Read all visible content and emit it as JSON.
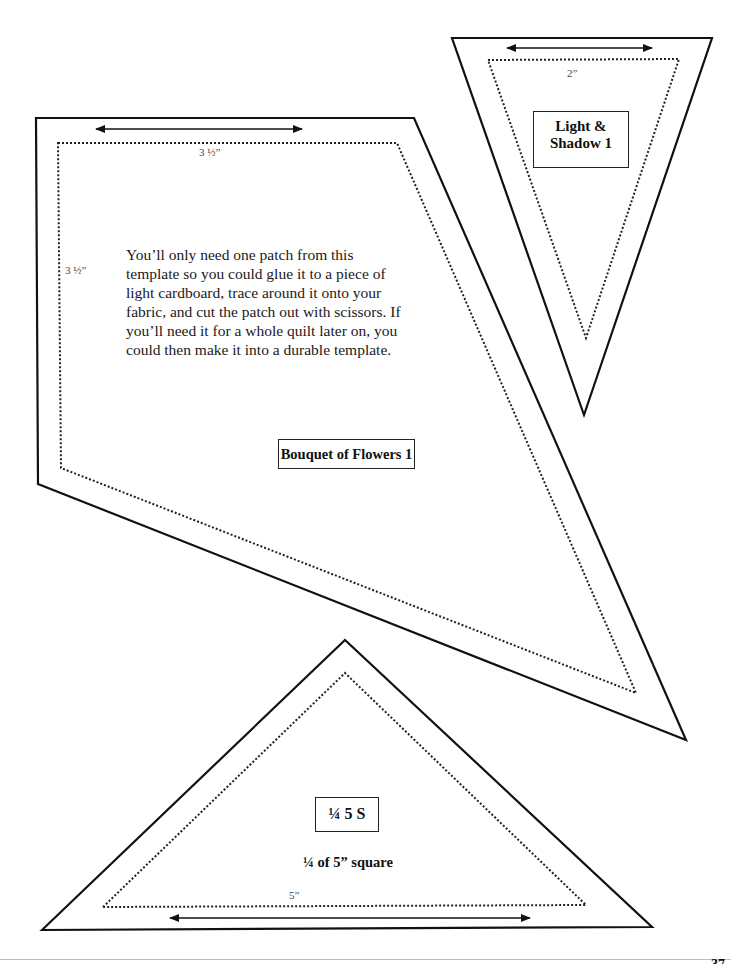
{
  "templates": {
    "light_shadow": {
      "label": "Light & Shadow 1",
      "label_line1": "Light &",
      "label_line2": "Shadow 1",
      "dimension": "2”"
    },
    "bouquet": {
      "label": "Bouquet of Flowers 1",
      "dimension_top": "3 ½”",
      "dimension_side": "3 ½”",
      "instructions": "You’ll only need one patch from this template so you could glue it to a piece of light cardboard, trace around it onto your fabric, and cut the patch out with scissors.  If you’ll need it for a whole quilt later on, you could then make it into a durable template."
    },
    "quarter_square": {
      "label": "¼ 5 S",
      "subtitle": "¼ of 5” square",
      "dimension": "5”"
    }
  },
  "page": {
    "number": "37"
  }
}
